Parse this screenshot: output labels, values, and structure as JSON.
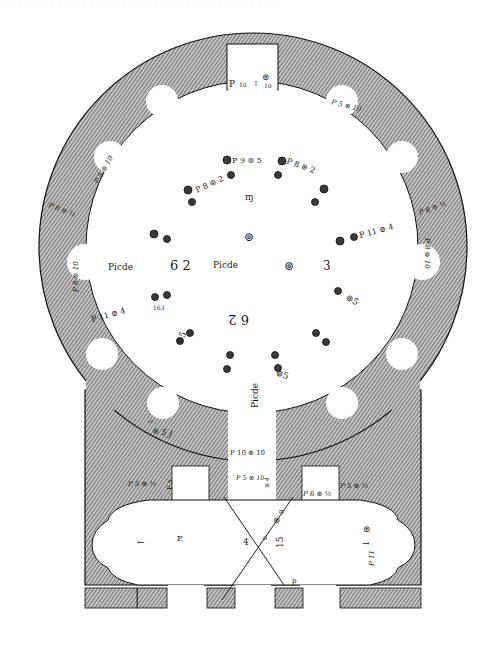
{
  "figure": {
    "type": "architectural-floor-plan",
    "style": "engraving",
    "colors": {
      "wall_hatch": "#555555",
      "wall_bg": "#bdbdbd",
      "ink": "#1a1a1a",
      "paper": "#ffffff"
    }
  },
  "bleed_text": "· · · · · · · · · · · · · · · · · · · · · · · · · · · · · · · · · · · · · · · · · · ·",
  "labels": {
    "top_niche_p": "P",
    "top_niche_num": "10",
    "top_niche_dim": "10",
    "upper_right_niche": "P 5 ⊚ 10",
    "upper_left_niche": "P 5 ⊚ 10",
    "left_wall_upper": "P 8 ⊚ ½",
    "right_wall_upper": "P 8 ⊚ ½",
    "left_niche": "P 8 ⊚ 10",
    "right_niche": "P 8 ⊚ 10",
    "arc_left": "P 8 ⊚ 2",
    "arc_center": "P 9 ⊚ 5",
    "arc_right": "P 8 ⊚ 2",
    "col_left": "P 11 ⊚ 4",
    "col_right": "P 11 ⊚ 4",
    "small_163": "163",
    "picde_left": "Picde",
    "num_62_left": "6 2",
    "num_62_bottom": "6 2",
    "num_3_right": "3",
    "center_glyph": "⊚",
    "top_center_mark": "ɱ",
    "left_bottom_niche": "⊚ 5 J",
    "left_bottom_or": "or",
    "picde_bottom": "Picde",
    "spiral_5_right": "⊚5",
    "spiral_5_bottom": "⊚5",
    "spiral_5_left": "⊚5",
    "entrance_label": "P 10 ⊚ 10",
    "door_left": "P 5 ⊚ 10",
    "door_right_small": "⊚ 4",
    "door_right": "P 6 ⊚ ½",
    "right_wing_wall": "P 5 ⊚ ½",
    "left_wing_wall": "P 5 ⊚ ½",
    "left_room_p": "P.",
    "left_room_arrow": "←",
    "center_4": "4",
    "center_o": "o",
    "center_8": "8",
    "center_spiral": "⊚",
    "center_15": "15",
    "right_room_arrow": "→",
    "right_room_p11": "P 11",
    "right_room_spiral": "⊚",
    "diag_end": "p"
  }
}
